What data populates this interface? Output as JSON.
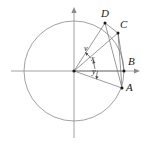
{
  "figure": {
    "canvas": {
      "width": 146,
      "height": 144
    },
    "colors": {
      "stroke": "#8a8a8a",
      "axis": "#8a8a8a",
      "chord": "#6e6e6e",
      "point": "#1a1a1a",
      "text": "#1a1a1a",
      "background": "#ffffff"
    },
    "circle": {
      "center": {
        "x": 74,
        "y": 71
      },
      "radius": 50,
      "label": "unit-circle"
    },
    "axes": {
      "x_axis": {
        "x1": 11,
        "y1": 71,
        "x2": 140,
        "y2": 71,
        "arrow": "right"
      },
      "y_axis": {
        "x1": 74,
        "y1": 138,
        "x2": 74,
        "y2": 7,
        "arrow": "up"
      }
    },
    "points": [
      {
        "id": "A",
        "label": "A",
        "x": 122,
        "y": 88,
        "label_x": 126,
        "label_y": 87,
        "angle_deg": -19.9
      },
      {
        "id": "B",
        "label": "B",
        "x": 124,
        "y": 71,
        "label_x": 128,
        "label_y": 60,
        "angle_deg": 0
      },
      {
        "id": "C",
        "label": "C",
        "x": 118,
        "y": 33,
        "label_x": 121,
        "label_y": 23,
        "angle_deg": 37.3
      },
      {
        "id": "D",
        "label": "D",
        "x": 105,
        "y": 23,
        "label_x": 103,
        "label_y": 11,
        "angle_deg": 58.1
      }
    ],
    "radii": [
      {
        "from": "origin",
        "to": "A",
        "name": "radius-OA"
      },
      {
        "from": "origin",
        "to": "B",
        "name": "radius-OB"
      },
      {
        "from": "origin",
        "to": "C",
        "name": "radius-OC"
      },
      {
        "from": "origin",
        "to": "D",
        "name": "radius-OD"
      }
    ],
    "chords": [
      {
        "from": "D",
        "to": "C",
        "name": "chord-DC"
      },
      {
        "from": "D",
        "to": "A",
        "name": "chord-DA"
      },
      {
        "from": "C",
        "to": "A",
        "name": "chord-CA"
      },
      {
        "from": "C",
        "to": "B",
        "name": "chord-CB"
      }
    ],
    "angles": [
      {
        "id": "v",
        "label": "v",
        "description": "angle between radius OC and radius OD",
        "label_x": 85,
        "label_y": 49,
        "arc_radius": 21,
        "start_deg": 37.3,
        "end_deg": 58.1
      },
      {
        "id": "x",
        "label": "x",
        "description": "angle between radius OB and radius OC",
        "label_x": 91,
        "label_y": 59,
        "arc_radius": 27,
        "start_deg": 0,
        "end_deg": 37.3
      },
      {
        "id": "y",
        "label": "y",
        "description": "angle between radius OA and radius OB",
        "label_x": 92,
        "label_y": 71,
        "arc_radius": 24,
        "start_deg": -19.9,
        "end_deg": 0
      }
    ]
  }
}
